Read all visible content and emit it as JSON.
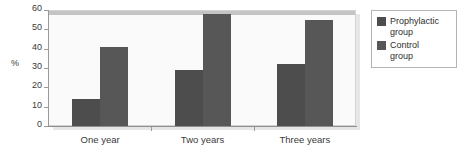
{
  "chart_data": {
    "type": "bar",
    "title": "",
    "subtitle": "",
    "xlabel": "",
    "ylabel": "%",
    "categories": [
      "One year",
      "Two years",
      "Three years"
    ],
    "series": [
      {
        "name": "Prophylactic group",
        "legend_label": "Prophylactic\ngroup",
        "color": "#4d4d4d",
        "values": [
          14,
          29,
          32
        ]
      },
      {
        "name": "Control group",
        "legend_label": "Control\ngroup",
        "color": "#575757",
        "values": [
          41,
          58,
          55
        ]
      }
    ],
    "ylim": [
      0,
      60
    ],
    "y_ticks": [
      0,
      10,
      20,
      30,
      40,
      50,
      60
    ],
    "y_tick_labels": [
      "0",
      "10",
      "20",
      "30",
      "40",
      "50",
      "60"
    ],
    "grid": false,
    "legend_position": "right",
    "plot_background": "#fafafa",
    "axis_color": "#9a9a9a",
    "text_color": "#3a3a3a"
  },
  "legend": {
    "entries": [
      {
        "label": "Prophylactic\ngroup",
        "color": "#4d4d4d"
      },
      {
        "label": "Control\ngroup",
        "color": "#575757"
      }
    ]
  },
  "axes": {
    "y_title": "%"
  }
}
